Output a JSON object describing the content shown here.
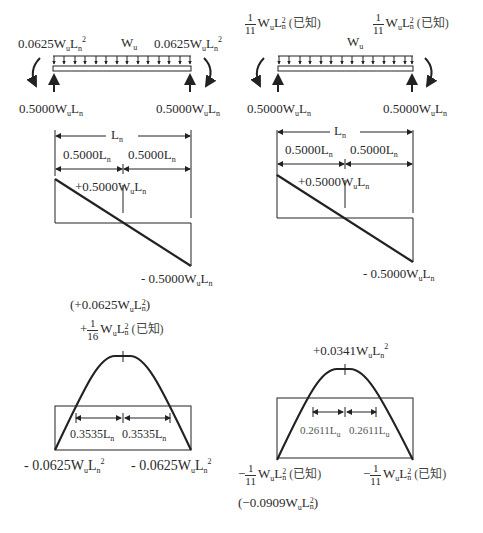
{
  "left": {
    "beam": {
      "end_moment_left": "0.0625W",
      "end_moment_right": "0.0625W",
      "load_label": "W",
      "reaction_left": "0.5000W",
      "reaction_right": "0.5000W"
    },
    "shear": {
      "span_label": "L",
      "half_left": "0.5000L",
      "half_right": "0.5000L",
      "max_positive": "+0.5000W",
      "max_negative": "- 0.5000W"
    },
    "moment": {
      "peak_numeric": "(+0.0625W",
      "peak_fraction_sign": "+",
      "peak_fraction_num": "1",
      "peak_fraction_den": "16",
      "peak_note": "(已知)",
      "zero_left": "0.3535L",
      "zero_right": "0.3535L",
      "end_left": "- 0.0625W",
      "end_right": "- 0.0625W"
    }
  },
  "right": {
    "beam": {
      "end_moment_num": "1",
      "end_moment_den": "11",
      "end_moment_note": "(已知)",
      "load_label": "W",
      "reaction_left": "0.5000W",
      "reaction_right": "0.5000W"
    },
    "shear": {
      "span_label": "L",
      "half_left": "0.5000L",
      "half_right": "0.5000L",
      "max_positive": "+0.5000W",
      "max_negative": "- 0.5000W"
    },
    "moment": {
      "peak": "+0.0341W",
      "zero_left": "0.2611L",
      "zero_right": "0.2611L",
      "end_sign": "−",
      "end_num": "1",
      "end_den": "11",
      "end_note": "(已知)",
      "end_numeric": "(−0.0909W"
    }
  },
  "symbols": {
    "u": "u",
    "n": "n",
    "L": "L",
    "sq": "2",
    "close_paren": ")"
  }
}
